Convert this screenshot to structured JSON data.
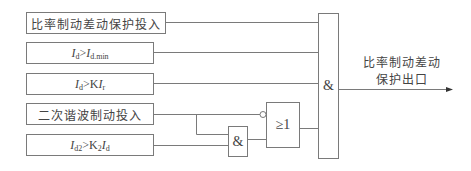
{
  "diagram": {
    "inputs": [
      {
        "id": "in1",
        "label": "比率制动差动保护投入",
        "type": "text"
      },
      {
        "id": "in2",
        "label_parts": {
          "a": "I",
          "a_sub": "d",
          "op": ">",
          "b": "I",
          "b_sub": "d.min"
        },
        "plain": "Id>Id.min"
      },
      {
        "id": "in3",
        "label_parts": {
          "a": "I",
          "a_sub": "d",
          "op": ">",
          "k": "K",
          "b": "I",
          "b_sub": "r"
        },
        "plain": "Id>KIr"
      },
      {
        "id": "in4",
        "label": "二次谐波制动投入",
        "type": "text"
      },
      {
        "id": "in5",
        "label_parts": {
          "a": "I",
          "a_sub": "d2",
          "op": ">",
          "k": "K",
          "k_sub": "2",
          "b": "I",
          "b_sub": "d"
        },
        "plain": "Id2>K2Id"
      }
    ],
    "gates": {
      "and_small": {
        "symbol": "&"
      },
      "or_gate": {
        "symbol": "≥1",
        "inverted_input": "二次谐波制动投入"
      },
      "and_main": {
        "symbol": "&"
      }
    },
    "output": {
      "line1": "比率制动差动",
      "line2": "保护出口"
    }
  }
}
